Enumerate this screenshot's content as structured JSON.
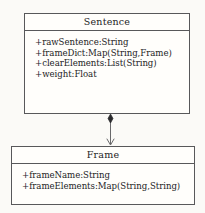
{
  "diagram": {
    "type": "uml-class-diagram",
    "background_color": "#fbfaf7",
    "stroke_color": "#58585a",
    "text_color": "#1d1d1f",
    "classes": [
      {
        "name": "Sentence",
        "attributes": [
          "+rawSentence:String",
          "+frameDict:Map(String,Frame)",
          "+clearElements:List(String)",
          "+weight:Float"
        ]
      },
      {
        "name": "Frame",
        "attributes": [
          "+frameName:String",
          "+frameElements:Map(String,String)"
        ]
      }
    ],
    "relationship": {
      "kind": "composition",
      "source": "Sentence",
      "target": "Frame",
      "source_decoration": "filled-diamond",
      "target_decoration": "open-arrow"
    }
  }
}
